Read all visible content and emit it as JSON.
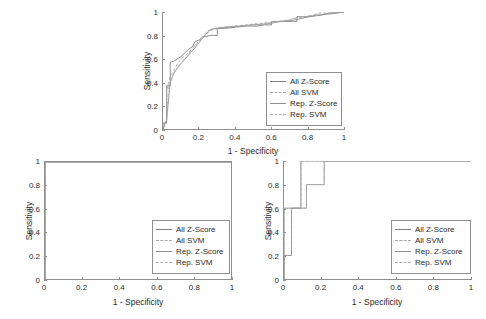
{
  "figure": {
    "background": "#ffffff",
    "axis_color": "#8f8f8f",
    "text_color": "#2b2b2b"
  },
  "legend_series": [
    {
      "label": "All Z-Score",
      "color": "#808080",
      "style": "solid"
    },
    {
      "label": "All SVM",
      "color": "#a8a8a8",
      "style": "dashed"
    },
    {
      "label": "Rep. Z-Score",
      "color": "#909090",
      "style": "solid"
    },
    {
      "label": "Rep. SVM",
      "color": "#b0b0b0",
      "style": "dashdot"
    }
  ],
  "chart_data": [
    {
      "id": "top-roc",
      "type": "line",
      "title": "",
      "xlabel": "1 - Specificity",
      "ylabel": "Sensitivity",
      "xlim": [
        0,
        1
      ],
      "ylim": [
        0,
        1
      ],
      "xticks": [
        "0",
        "0.2",
        "0.4",
        "0.6",
        "0.8",
        "1"
      ],
      "xtick_values": [
        0,
        0.2,
        0.4,
        0.6,
        0.8,
        1
      ],
      "yticks": [
        "0",
        "0.2",
        "0.4",
        "0.6",
        "0.8",
        "1"
      ],
      "ytick_values": [
        0,
        0.2,
        0.4,
        0.6,
        0.8,
        1
      ],
      "grid": false,
      "legend_position": "lower-right",
      "series": [
        {
          "name": "All Z-Score",
          "color": "#808080",
          "style": "solid",
          "x": [
            0,
            0,
            0.02,
            0.02,
            0.04,
            0.04,
            0.06,
            0.08,
            0.1,
            0.12,
            0.14,
            0.16,
            0.18,
            0.2,
            0.22,
            0.24,
            0.26,
            0.28,
            0.3,
            0.3,
            0.34,
            0.4,
            0.46,
            0.52,
            0.56,
            0.6,
            0.6,
            0.66,
            0.72,
            0.74,
            0.74,
            0.8,
            0.86,
            0.92,
            1.0
          ],
          "y": [
            0,
            0.05,
            0.05,
            0.37,
            0.37,
            0.57,
            0.58,
            0.6,
            0.62,
            0.65,
            0.68,
            0.7,
            0.75,
            0.76,
            0.79,
            0.79,
            0.8,
            0.8,
            0.8,
            0.86,
            0.86,
            0.87,
            0.88,
            0.88,
            0.89,
            0.89,
            0.92,
            0.92,
            0.92,
            0.92,
            0.96,
            0.96,
            0.97,
            0.99,
            1.0
          ]
        },
        {
          "name": "All SVM",
          "color": "#a8a8a8",
          "style": "dashed",
          "x": [
            0,
            0.02,
            0.02,
            0.04,
            0.06,
            0.08,
            0.1,
            0.14,
            0.18,
            0.22,
            0.26,
            0.3,
            0.34,
            0.4,
            0.46,
            0.52,
            0.58,
            0.64,
            0.7,
            0.74,
            0.8,
            0.86,
            0.9,
            0.94,
            1.0
          ],
          "y": [
            0,
            0.1,
            0.33,
            0.45,
            0.5,
            0.56,
            0.6,
            0.65,
            0.72,
            0.78,
            0.84,
            0.86,
            0.87,
            0.88,
            0.89,
            0.9,
            0.91,
            0.92,
            0.93,
            0.95,
            0.96,
            0.99,
            0.99,
            0.99,
            1.0
          ]
        },
        {
          "name": "Rep. Z-Score",
          "color": "#909090",
          "style": "solid",
          "x": [
            0,
            0.02,
            0.04,
            0.06,
            0.1,
            0.14,
            0.18,
            0.22,
            0.26,
            0.3,
            0.36,
            0.42,
            0.5,
            0.58,
            0.66,
            0.72,
            0.78,
            0.84,
            0.9,
            0.96,
            1.0
          ],
          "y": [
            0,
            0.08,
            0.4,
            0.48,
            0.56,
            0.63,
            0.7,
            0.78,
            0.85,
            0.86,
            0.87,
            0.88,
            0.89,
            0.9,
            0.92,
            0.93,
            0.95,
            0.97,
            0.98,
            0.99,
            1.0
          ]
        },
        {
          "name": "Rep. SVM",
          "color": "#b0b0b0",
          "style": "dashdot",
          "x": [
            0,
            0.02,
            0.03,
            0.05,
            0.08,
            0.12,
            0.16,
            0.2,
            0.24,
            0.28,
            0.32,
            0.38,
            0.44,
            0.52,
            0.6,
            0.68,
            0.76,
            0.82,
            0.88,
            0.94,
            1.0
          ],
          "y": [
            0,
            0.06,
            0.35,
            0.44,
            0.53,
            0.6,
            0.68,
            0.76,
            0.83,
            0.86,
            0.87,
            0.88,
            0.88,
            0.89,
            0.91,
            0.93,
            0.96,
            0.97,
            0.98,
            1.0,
            1.0
          ]
        }
      ]
    },
    {
      "id": "bottom-left-roc",
      "type": "line",
      "title": "",
      "xlabel": "1 - Specificity",
      "ylabel": "Sensitivity",
      "xlim": [
        0,
        1
      ],
      "ylim": [
        0,
        1
      ],
      "xticks": [
        "0",
        "0.2",
        "0.4",
        "0.6",
        "0.8",
        "1"
      ],
      "xtick_values": [
        0,
        0.2,
        0.4,
        0.6,
        0.8,
        1
      ],
      "yticks": [
        "0",
        "0.2",
        "0.4",
        "0.6",
        "0.8",
        "1"
      ],
      "ytick_values": [
        0,
        0.2,
        0.4,
        0.6,
        0.8,
        1
      ],
      "grid": false,
      "legend_position": "lower-right",
      "series": [
        {
          "name": "All Z-Score",
          "color": "#808080",
          "style": "solid",
          "x": [
            0,
            0,
            1
          ],
          "y": [
            0,
            1,
            1
          ]
        },
        {
          "name": "All SVM",
          "color": "#a8a8a8",
          "style": "dashed",
          "x": [
            0,
            0,
            1
          ],
          "y": [
            0,
            1,
            1
          ]
        },
        {
          "name": "Rep. Z-Score",
          "color": "#909090",
          "style": "solid",
          "x": [
            0,
            0,
            1
          ],
          "y": [
            0,
            1,
            1
          ]
        },
        {
          "name": "Rep. SVM",
          "color": "#b0b0b0",
          "style": "dashdot",
          "x": [
            0,
            0,
            1
          ],
          "y": [
            0,
            1,
            1
          ]
        }
      ]
    },
    {
      "id": "bottom-right-roc",
      "type": "line",
      "title": "",
      "xlabel": "1 - Specificity",
      "ylabel": "Sensitivity",
      "xlim": [
        0,
        1
      ],
      "ylim": [
        0,
        1
      ],
      "xticks": [
        "0",
        "0.2",
        "0.4",
        "0.6",
        "0.8",
        "1"
      ],
      "xtick_values": [
        0,
        0.2,
        0.4,
        0.6,
        0.8,
        1
      ],
      "yticks": [
        "0",
        "0.2",
        "0.4",
        "0.6",
        "0.8",
        "1"
      ],
      "ytick_values": [
        0,
        0.2,
        0.4,
        0.6,
        0.8,
        1
      ],
      "grid": false,
      "legend_position": "lower-right",
      "series": [
        {
          "name": "All Z-Score",
          "color": "#808080",
          "style": "solid",
          "x": [
            0,
            0,
            0.04,
            0.04,
            0.09,
            0.09,
            1
          ],
          "y": [
            0,
            0.2,
            0.2,
            0.6,
            0.6,
            1.0,
            1.0
          ]
        },
        {
          "name": "All SVM",
          "color": "#a8a8a8",
          "style": "dashed",
          "x": [
            0,
            0,
            0.04,
            0.04,
            0.09,
            0.09,
            1
          ],
          "y": [
            0,
            0.2,
            0.2,
            0.6,
            0.6,
            1.0,
            1.0
          ]
        },
        {
          "name": "Rep. Z-Score",
          "color": "#909090",
          "style": "solid",
          "x": [
            0,
            0,
            0.12,
            0.12,
            0.215,
            0.215,
            1
          ],
          "y": [
            0,
            0.6,
            0.6,
            0.8,
            0.8,
            1.0,
            1.0
          ]
        },
        {
          "name": "Rep. SVM",
          "color": "#b0b0b0",
          "style": "dashdot",
          "x": [
            0,
            0,
            0.12,
            0.12,
            0.215,
            0.215,
            1
          ],
          "y": [
            0,
            0.6,
            0.6,
            0.8,
            0.8,
            1.0,
            1.0
          ]
        }
      ]
    }
  ]
}
